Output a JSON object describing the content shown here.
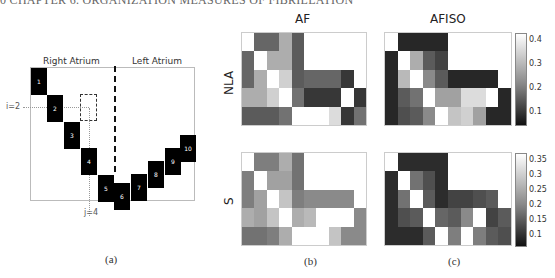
{
  "running_head": "0 CHAPTER 6. ORGANIZATION MEASURES OF FIBRILLATION",
  "panel_a": {
    "caption": "(a)",
    "region_labels": [
      "Right Atrium",
      "Left Atrium"
    ],
    "i_label": "i=2",
    "j_label": "j=4",
    "blocks": [
      {
        "n": "1",
        "x": 31,
        "y": 68
      },
      {
        "n": "2",
        "x": 47,
        "y": 95
      },
      {
        "n": "3",
        "x": 64,
        "y": 122
      },
      {
        "n": "4",
        "x": 81,
        "y": 148
      },
      {
        "n": "5",
        "x": 98,
        "y": 175
      },
      {
        "n": "6",
        "x": 114,
        "y": 183
      },
      {
        "n": "7",
        "x": 131,
        "y": 174
      },
      {
        "n": "8",
        "x": 148,
        "y": 161
      },
      {
        "n": "9",
        "x": 165,
        "y": 148
      },
      {
        "n": "10",
        "x": 180,
        "y": 135
      }
    ]
  },
  "panel_b": {
    "caption": "(b)",
    "title": "AF"
  },
  "panel_c": {
    "caption": "(c)",
    "title": "AFISO"
  },
  "row_labels": [
    "NLA",
    "S"
  ],
  "colorbars": [
    {
      "ticks": [
        "0.4",
        "0.3",
        "0.2",
        "0.1"
      ]
    },
    {
      "ticks": [
        "0.35",
        "0.3",
        "0.25",
        "0.2",
        "0.15",
        "0.1"
      ]
    }
  ],
  "chart_data": [
    {
      "type": "heatmap",
      "title": "AF",
      "row_label": "NLA",
      "rows": 5,
      "cols": 10,
      "values": [
        [
          1.0,
          0.35,
          0.35,
          0.65,
          0.3,
          1,
          1,
          1,
          1,
          1
        ],
        [
          0.35,
          1.0,
          0.65,
          0.65,
          0.3,
          1,
          1,
          1,
          1,
          1
        ],
        [
          0.35,
          0.65,
          1.0,
          0.8,
          0.3,
          0.35,
          0.35,
          0.35,
          0.15,
          1
        ],
        [
          0.65,
          0.65,
          0.8,
          1.0,
          0.4,
          0.15,
          0.15,
          0.15,
          1.0,
          0.15
        ],
        [
          0.3,
          0.3,
          0.3,
          0.4,
          1.0,
          1.0,
          1.0,
          0.85,
          0.15,
          0.4
        ]
      ]
    },
    {
      "type": "heatmap",
      "title": "AFISO",
      "row_label": "NLA",
      "rows": 5,
      "cols": 10,
      "colorbar_range": [
        0.05,
        0.42
      ],
      "values": [
        [
          1.0,
          0.08,
          0.08,
          0.08,
          0.08,
          1,
          1,
          1,
          1,
          1
        ],
        [
          0.08,
          1.0,
          0.65,
          0.3,
          0.2,
          1,
          1,
          1,
          1,
          1
        ],
        [
          0.08,
          0.7,
          1.0,
          0.5,
          0.3,
          0.08,
          0.08,
          0.08,
          0.08,
          1
        ],
        [
          0.08,
          0.3,
          0.4,
          1.0,
          0.6,
          0.6,
          0.85,
          0.85,
          1.0,
          0.08
        ],
        [
          0.08,
          0.25,
          0.3,
          0.5,
          1.0,
          0.75,
          0.8,
          0.6,
          0.08,
          0.08
        ]
      ]
    },
    {
      "type": "heatmap",
      "title": "AF",
      "row_label": "S",
      "rows": 5,
      "cols": 10,
      "values": [
        [
          1.0,
          0.45,
          0.45,
          0.65,
          0.4,
          1,
          1,
          1,
          1,
          1
        ],
        [
          0.45,
          1.0,
          0.6,
          0.6,
          0.4,
          1,
          1,
          1,
          1,
          1
        ],
        [
          0.45,
          0.6,
          1.0,
          0.75,
          0.45,
          0.5,
          0.5,
          0.5,
          0.5,
          1
        ],
        [
          0.65,
          0.6,
          0.75,
          1.0,
          0.65,
          0.7,
          1.0,
          1.0,
          1.0,
          0.5
        ],
        [
          0.4,
          0.4,
          0.45,
          0.65,
          1.0,
          1.0,
          1.0,
          0.75,
          0.5,
          0.5
        ]
      ]
    },
    {
      "type": "heatmap",
      "title": "AFISO",
      "row_label": "S",
      "rows": 5,
      "cols": 10,
      "colorbar_range": [
        0.05,
        0.38
      ],
      "values": [
        [
          1.0,
          0.1,
          0.1,
          0.1,
          0.1,
          1,
          1,
          1,
          1,
          1
        ],
        [
          0.1,
          1.0,
          0.4,
          0.25,
          0.1,
          1,
          1,
          1,
          1,
          1
        ],
        [
          0.1,
          0.4,
          1.0,
          0.3,
          0.1,
          0.2,
          0.2,
          0.25,
          0.3,
          1
        ],
        [
          0.1,
          0.25,
          0.3,
          1.0,
          0.35,
          0.3,
          0.5,
          1.0,
          0.2,
          0.3
        ],
        [
          0.1,
          0.1,
          0.1,
          0.3,
          1.0,
          0.45,
          1.0,
          0.45,
          0.3,
          0.25
        ]
      ]
    }
  ]
}
